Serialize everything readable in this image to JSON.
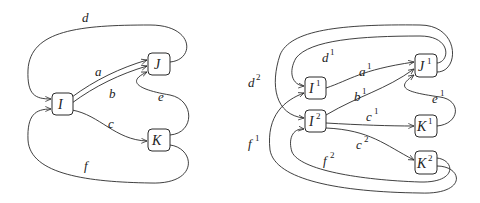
{
  "diagrams": [
    {
      "name": "base-graph",
      "nodes": [
        {
          "id": "I",
          "label": "I",
          "sup": ""
        },
        {
          "id": "J",
          "label": "J",
          "sup": ""
        },
        {
          "id": "K",
          "label": "K",
          "sup": ""
        }
      ],
      "edges": [
        {
          "label": "a",
          "sup": "",
          "from": "I",
          "to": "J"
        },
        {
          "label": "b",
          "sup": "",
          "from": "I",
          "to": "J"
        },
        {
          "label": "c",
          "sup": "",
          "from": "I",
          "to": "K"
        },
        {
          "label": "d",
          "sup": "",
          "from": "J",
          "to": "I"
        },
        {
          "label": "e",
          "sup": "",
          "from": "K",
          "to": "J"
        },
        {
          "label": "f",
          "sup": "",
          "from": "K",
          "to": "I"
        }
      ]
    },
    {
      "name": "cover-graph",
      "nodes": [
        {
          "id": "I1",
          "label": "I",
          "sup": "1"
        },
        {
          "id": "I2",
          "label": "I",
          "sup": "2"
        },
        {
          "id": "J1",
          "label": "J",
          "sup": "1"
        },
        {
          "id": "K1",
          "label": "K",
          "sup": "1"
        },
        {
          "id": "K2",
          "label": "K",
          "sup": "2"
        }
      ],
      "edges": [
        {
          "label": "a",
          "sup": "1",
          "from": "I1",
          "to": "J1"
        },
        {
          "label": "b",
          "sup": "1",
          "from": "I2",
          "to": "J1"
        },
        {
          "label": "c",
          "sup": "1",
          "from": "I2",
          "to": "K1"
        },
        {
          "label": "c",
          "sup": "2",
          "from": "I2",
          "to": "K2"
        },
        {
          "label": "d",
          "sup": "1",
          "from": "J1",
          "to": "I1"
        },
        {
          "label": "d",
          "sup": "2",
          "from": "J1",
          "to": "I2"
        },
        {
          "label": "e",
          "sup": "1",
          "from": "K1",
          "to": "J1"
        },
        {
          "label": "f",
          "sup": "1",
          "from": "K2",
          "to": "I1"
        },
        {
          "label": "f",
          "sup": "2",
          "from": "K2",
          "to": "I2"
        }
      ]
    }
  ]
}
